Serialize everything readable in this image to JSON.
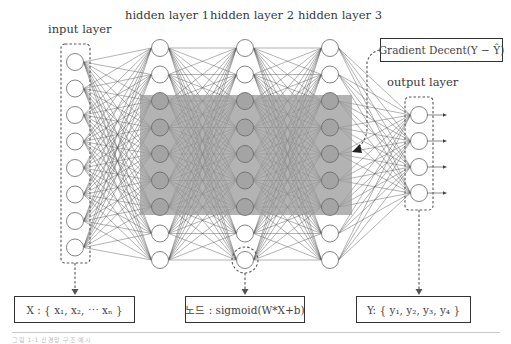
{
  "labels": {
    "input_layer": "input layer",
    "hidden_layer_1": "hidden layer 1",
    "hidden_layer_2": "hidden layer 2",
    "hidden_layer_3": "hidden layer 3",
    "output_layer": "output layer"
  },
  "boxes": {
    "gradient": "Gradient Decent(Y − Ŷ)",
    "input_vector": "X : { x₁, x₂, ⋯ xₙ }",
    "node_formula": "노드 : sigmoid(W*X+b)",
    "output_vector": "Y: { y₁, y₂, y₃, y₄ }"
  },
  "network": {
    "layers": [
      {
        "name": "input",
        "x": 75,
        "nodes": 8,
        "y_start": 62,
        "spacing": 26.5
      },
      {
        "name": "hidden1",
        "x": 160,
        "nodes": 9,
        "y_start": 48,
        "spacing": 26.5
      },
      {
        "name": "hidden2",
        "x": 245,
        "nodes": 9,
        "y_start": 48,
        "spacing": 26.5
      },
      {
        "name": "hidden3",
        "x": 330,
        "nodes": 9,
        "y_start": 48,
        "spacing": 26.5
      },
      {
        "name": "output",
        "x": 419,
        "nodes": 4,
        "y_start": 115,
        "spacing": 26
      }
    ],
    "node_radius": 8.5,
    "highlight_region": {
      "x": 140,
      "y": 95,
      "w": 212,
      "h": 120,
      "color": "#9a9a9a"
    }
  },
  "caption": "그림 1-1 신경망 구조 예시"
}
